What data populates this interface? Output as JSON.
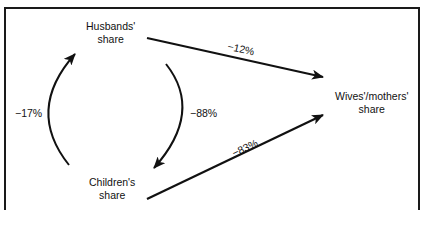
{
  "diagram": {
    "nodes": {
      "husbands": {
        "line1": "Husbands'",
        "line2": "share"
      },
      "wives": {
        "line1": "Wives'/mothers'",
        "line2": "share"
      },
      "children": {
        "line1": "Children's",
        "line2": "share"
      }
    },
    "edges": {
      "husbands_to_wives": "−12%",
      "children_to_husbands": "−17%",
      "husbands_to_children": "−88%",
      "children_to_wives": "−83%"
    },
    "colors": {
      "line": "#111111",
      "background": "#ffffff"
    }
  }
}
